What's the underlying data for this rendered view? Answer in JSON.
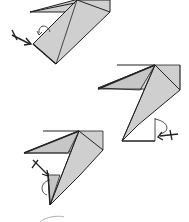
{
  "diagram": {
    "type": "origami-instructions",
    "colors": {
      "paper": "#cfcfcf",
      "line": "#222222",
      "background": "#ffffff"
    },
    "steps": [
      {
        "id": "step-1",
        "symbol": "fold-arrow-with-x"
      },
      {
        "id": "step-2",
        "symbol": "fold-arrow-with-x"
      },
      {
        "id": "step-3",
        "symbol": "fold-arrow-with-x"
      },
      {
        "id": "step-4",
        "symbol": "partial-shape"
      }
    ]
  }
}
